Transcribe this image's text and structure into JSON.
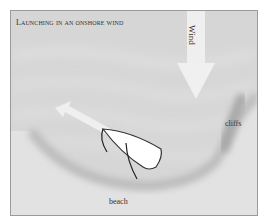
{
  "diagram": {
    "title": "Launching in an onshore wind",
    "labels": {
      "wind": "Wind",
      "cliffs": "cliffs",
      "beach": "beach"
    },
    "colors": {
      "sea": "#d4d4d4",
      "beach": "#e2e2e2",
      "arrow": "#efefef",
      "boat": "#ffffff",
      "border": "#9a9a9a"
    }
  }
}
